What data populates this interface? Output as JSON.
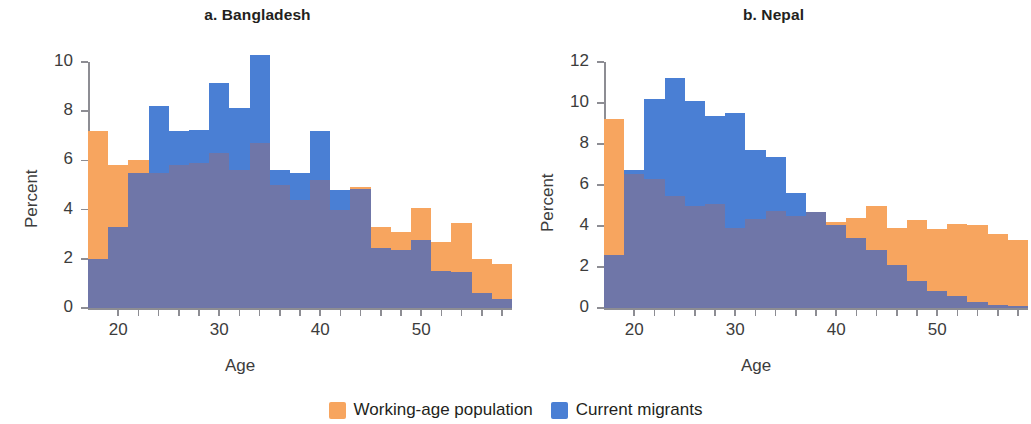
{
  "figure": {
    "legend": {
      "items": [
        {
          "label": "Working-age population",
          "color": "#f7a55f",
          "icon": "square-swatch"
        },
        {
          "label": "Current migrants",
          "color": "#4a7fd4",
          "icon": "square-swatch"
        }
      ]
    }
  },
  "chart_data": [
    {
      "type": "bar",
      "title": "a. Bangladesh",
      "xlabel": "Age",
      "ylabel": "Percent",
      "ylim": [
        0,
        10
      ],
      "xlim": [
        17,
        59
      ],
      "grid": false,
      "legend_position": "bottom-center",
      "yticks": [
        0,
        2,
        4,
        6,
        8,
        10
      ],
      "ytick_labels": [
        "0",
        "2",
        "4",
        "6",
        "8",
        "10"
      ],
      "xticks": [
        20,
        22,
        24,
        26,
        28,
        30,
        32,
        34,
        36,
        38,
        40,
        42,
        44,
        46,
        48,
        50,
        52,
        54,
        56,
        58
      ],
      "xtick_labels_shown": [
        "20",
        "30",
        "40",
        "50"
      ],
      "xtick_labels_positions": [
        20,
        30,
        40,
        50
      ],
      "bin_width": 2,
      "bin_starts": [
        17,
        19,
        21,
        23,
        25,
        27,
        29,
        31,
        33,
        35,
        37,
        39,
        41,
        43,
        45,
        47,
        49,
        51,
        53,
        55,
        57
      ],
      "series": [
        {
          "name": "Working-age population",
          "color": "#f7a55f",
          "values": [
            7.2,
            5.8,
            6.0,
            5.5,
            5.8,
            5.9,
            6.3,
            5.6,
            6.7,
            5.0,
            4.4,
            5.2,
            4.0,
            4.9,
            3.3,
            3.1,
            4.05,
            2.7,
            3.45,
            2.0,
            1.8
          ]
        },
        {
          "name": "Current migrants",
          "color": "#4a7fd4",
          "values": [
            2.0,
            3.3,
            5.5,
            8.2,
            7.2,
            7.25,
            9.15,
            8.15,
            10.3,
            5.6,
            5.5,
            7.2,
            4.8,
            4.85,
            2.45,
            2.35,
            2.75,
            1.5,
            1.45,
            0.6,
            0.35
          ]
        }
      ]
    },
    {
      "type": "bar",
      "title": "b. Nepal",
      "xlabel": "Age",
      "ylabel": "Percent",
      "ylim": [
        0,
        12
      ],
      "xlim": [
        17,
        59
      ],
      "grid": false,
      "legend_position": "bottom-center",
      "yticks": [
        0,
        2,
        4,
        6,
        8,
        10,
        12
      ],
      "ytick_labels": [
        "0",
        "2",
        "4",
        "6",
        "8",
        "10",
        "12"
      ],
      "xticks": [
        20,
        22,
        24,
        26,
        28,
        30,
        32,
        34,
        36,
        38,
        40,
        42,
        44,
        46,
        48,
        50,
        52,
        54,
        56,
        58
      ],
      "xtick_labels_shown": [
        "20",
        "30",
        "40",
        "50"
      ],
      "xtick_labels_positions": [
        20,
        30,
        40,
        50
      ],
      "bin_width": 2,
      "bin_starts": [
        17,
        19,
        21,
        23,
        25,
        27,
        29,
        31,
        33,
        35,
        37,
        39,
        41,
        43,
        45,
        47,
        49,
        51,
        53,
        55,
        57
      ],
      "series": [
        {
          "name": "Working-age population",
          "color": "#f7a55f",
          "values": [
            9.2,
            6.55,
            6.3,
            5.45,
            5.0,
            5.05,
            3.9,
            4.35,
            4.75,
            4.5,
            4.7,
            4.2,
            4.4,
            5.0,
            3.9,
            4.3,
            3.85,
            4.1,
            4.05,
            3.6,
            3.3
          ]
        },
        {
          "name": "Current migrants",
          "color": "#4a7fd4",
          "values": [
            2.6,
            6.75,
            10.2,
            11.2,
            10.1,
            9.35,
            9.5,
            7.7,
            7.35,
            5.6,
            4.7,
            4.05,
            3.4,
            2.85,
            2.1,
            1.3,
            0.85,
            0.6,
            0.3,
            0.15,
            0.1
          ]
        }
      ]
    }
  ]
}
